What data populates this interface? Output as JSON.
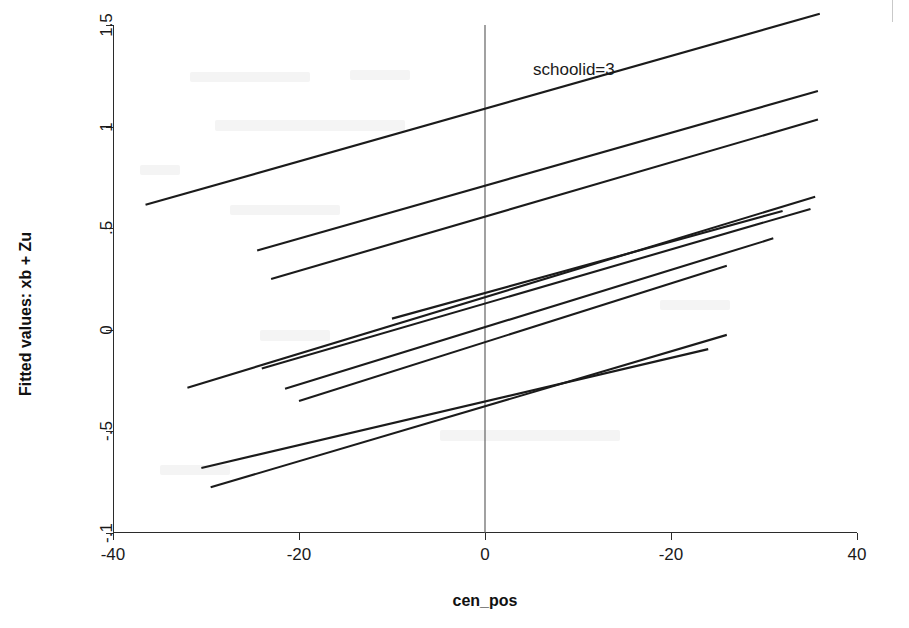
{
  "figure": {
    "background_color": "#ffffff",
    "line_color": "#1b1b1b",
    "reference_line_color": "#555555",
    "axis_color": "#2b2b2b"
  },
  "annotations": [
    {
      "name": "series-annotation",
      "text": "schoolid=3"
    }
  ],
  "chart_data": {
    "type": "line",
    "title": "",
    "subtitle": "",
    "xlabel": "cen_pos",
    "ylabel": "Fitted values: xb + Zu",
    "xlim": [
      -40,
      40
    ],
    "ylim": [
      -1,
      1.5
    ],
    "xticks": [
      -40,
      -20,
      0,
      20,
      40
    ],
    "xticklabels": [
      "-40",
      "-20",
      "0",
      "-20",
      "40"
    ],
    "yticks": [
      1.5,
      1,
      0.5,
      0,
      -0.5,
      -1
    ],
    "yticklabels": [
      "1.5",
      "1",
      ".5",
      "0",
      "-.5",
      "-.1"
    ],
    "grid": false,
    "legend": null,
    "legend_position": "none",
    "annotation_text": "schoolid=3",
    "reference_lines": [
      {
        "orientation": "vertical",
        "x": 0
      }
    ],
    "series": [
      {
        "name": "line-1",
        "x": [
          -36.5,
          36.0
        ],
        "y": [
          0.615,
          1.555
        ]
      },
      {
        "name": "line-2",
        "x": [
          -24.5,
          35.8
        ],
        "y": [
          0.39,
          1.175
        ]
      },
      {
        "name": "line-3",
        "x": [
          -23.0,
          35.8
        ],
        "y": [
          0.25,
          1.035
        ]
      },
      {
        "name": "line-4",
        "x": [
          -32.0,
          35.5
        ],
        "y": [
          -0.285,
          0.655
        ]
      },
      {
        "name": "line-5",
        "x": [
          -24.0,
          35.0
        ],
        "y": [
          -0.19,
          0.595
        ]
      },
      {
        "name": "line-6",
        "x": [
          -10.0,
          32.0
        ],
        "y": [
          0.055,
          0.585
        ]
      },
      {
        "name": "line-7",
        "x": [
          -21.5,
          31.0
        ],
        "y": [
          -0.29,
          0.45
        ]
      },
      {
        "name": "line-8",
        "x": [
          -20.0,
          26.0
        ],
        "y": [
          -0.35,
          0.315
        ]
      },
      {
        "name": "line-9",
        "x": [
          -30.5,
          24.0
        ],
        "y": [
          -0.68,
          -0.095
        ]
      },
      {
        "name": "line-10",
        "x": [
          -29.5,
          26.0
        ],
        "y": [
          -0.775,
          -0.025
        ]
      }
    ]
  }
}
